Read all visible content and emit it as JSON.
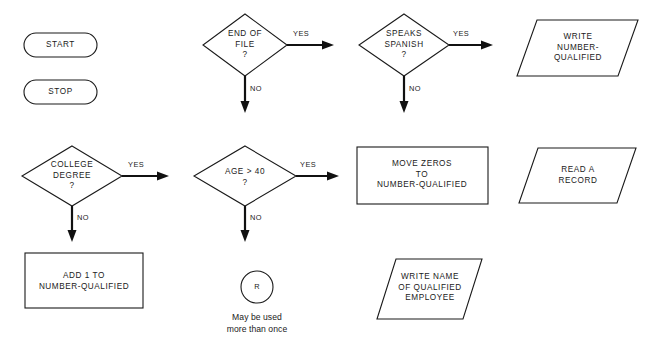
{
  "diagram": {
    "background_color": "#ffffff",
    "line_color": "#111111",
    "text_color": "#1a1a1a",
    "width": 657,
    "height": 344
  },
  "terminators": [
    {
      "id": "start",
      "label": "START"
    },
    {
      "id": "stop",
      "label": "STOP"
    }
  ],
  "decisions": [
    {
      "id": "end-of-file",
      "label": "END OF\nFILE\n?",
      "yes_label": "YES",
      "no_label": "NO"
    },
    {
      "id": "speaks-spanish",
      "label": "SPEAKS\nSPANISH\n?",
      "yes_label": "YES",
      "no_label": "NO"
    },
    {
      "id": "college-degree",
      "label": "COLLEGE\nDEGREE\n?",
      "yes_label": "YES",
      "no_label": "NO"
    },
    {
      "id": "age-over-40",
      "label": "AGE > 40\n?",
      "yes_label": "YES",
      "no_label": "NO"
    }
  ],
  "processes": [
    {
      "id": "move-zeros",
      "label": "MOVE ZEROS\nTO\nNUMBER-QUALIFIED"
    },
    {
      "id": "add-one",
      "label": "ADD 1 TO\nNUMBER-QUALIFIED"
    }
  ],
  "io_shapes": [
    {
      "id": "write-number-qualified",
      "label": "WRITE\nNUMBER-\nQUALIFIED"
    },
    {
      "id": "read-a-record",
      "label": "READ A\nRECORD"
    },
    {
      "id": "write-name",
      "label": "WRITE NAME\nOF QUALIFIED\nEMPLOYEE"
    }
  ],
  "connector": {
    "id": "connector-r",
    "label": "R",
    "caption": "May be used\nmore than once"
  }
}
